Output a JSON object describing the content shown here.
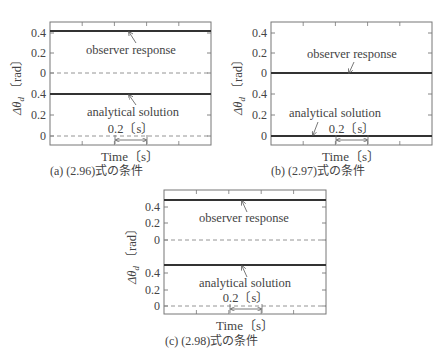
{
  "figure": {
    "xlabel": "Time〔s〕",
    "ylabel_symbol": "Δθ",
    "ylabel_sub": "d",
    "ylabel_unit": "〔rad〕",
    "scale_bar_label": "0.2〔s〕",
    "observer_label": "observer response",
    "analytical_label": "analytical solution"
  },
  "panels": [
    {
      "id": "a",
      "caption": "(a) (2.96)式の条件",
      "frame": {
        "x": 50,
        "y": 22,
        "w": 161,
        "h": 123
      },
      "upper_ticks": [
        {
          "label": "0.4",
          "y": 33
        },
        {
          "label": "0.2",
          "y": 53
        },
        {
          "label": "0",
          "y": 73
        }
      ],
      "lower_ticks": [
        {
          "label": "0.4",
          "y": 94
        },
        {
          "label": "0.2",
          "y": 115
        },
        {
          "label": "0",
          "y": 136
        }
      ],
      "observer_line_y": 31,
      "observer_zero_dashed": true,
      "analytical_line_y": 94,
      "analytical_zero_dashed": true,
      "observer_text": {
        "x": 86,
        "y": 54
      },
      "observer_arrow": {
        "x1": 136,
        "y1": 43,
        "x2": 129,
        "y2": 32
      },
      "analytical_text": {
        "x": 87,
        "y": 116
      },
      "analytical_arrow": {
        "x1": 136,
        "y1": 105,
        "x2": 129,
        "y2": 95
      },
      "scale": {
        "x1": 115,
        "x2": 147,
        "y": 140,
        "label_x": 131,
        "label_y": 133
      },
      "xlabel_pos": {
        "x": 130,
        "y": 161
      },
      "caption_pos": {
        "x": 50,
        "y": 175
      },
      "ylabel_pos": {
        "x": 21,
        "y": 84
      }
    },
    {
      "id": "b",
      "caption": "(b) (2.97)式の条件",
      "frame": {
        "x": 271,
        "y": 22,
        "w": 161,
        "h": 123
      },
      "upper_ticks": [
        {
          "label": "0.4",
          "y": 33
        },
        {
          "label": "0.2",
          "y": 53
        },
        {
          "label": "0",
          "y": 73
        }
      ],
      "lower_ticks": [
        {
          "label": "0.4",
          "y": 94
        },
        {
          "label": "0.2",
          "y": 115
        },
        {
          "label": "0",
          "y": 136
        }
      ],
      "observer_line_y": 73,
      "observer_zero_dashed": false,
      "analytical_line_y": 136,
      "analytical_zero_dashed": false,
      "observer_text": {
        "x": 307,
        "y": 58
      },
      "observer_arrow": {
        "x1": 354,
        "y1": 62,
        "x2": 349,
        "y2": 73
      },
      "analytical_text": {
        "x": 289,
        "y": 117
      },
      "analytical_arrow": {
        "x1": 318,
        "y1": 122,
        "x2": 313,
        "y2": 135
      },
      "scale": {
        "x1": 336,
        "x2": 368,
        "y": 140,
        "label_x": 352,
        "label_y": 133
      },
      "xlabel_pos": {
        "x": 351,
        "y": 161
      },
      "caption_pos": {
        "x": 271,
        "y": 175
      },
      "ylabel_pos": {
        "x": 242,
        "y": 84
      }
    },
    {
      "id": "c",
      "caption": "(c) (2.98)式の条件",
      "frame": {
        "x": 164,
        "y": 190,
        "w": 162,
        "h": 124
      },
      "upper_ticks": [
        {
          "label": "0.4",
          "y": 207
        },
        {
          "label": "0.2",
          "y": 223
        },
        {
          "label": "0",
          "y": 240
        }
      ],
      "lower_ticks": [
        {
          "label": "0.4",
          "y": 273
        },
        {
          "label": "0.2",
          "y": 290
        },
        {
          "label": "0",
          "y": 306
        }
      ],
      "observer_line_y": 200,
      "observer_zero_dashed": true,
      "analytical_line_y": 265,
      "analytical_zero_dashed": true,
      "observer_text": {
        "x": 199,
        "y": 222
      },
      "observer_arrow": {
        "x1": 247,
        "y1": 212,
        "x2": 242,
        "y2": 201
      },
      "analytical_text": {
        "x": 199,
        "y": 287
      },
      "analytical_arrow": {
        "x1": 247,
        "y1": 277,
        "x2": 242,
        "y2": 266
      },
      "scale": {
        "x1": 230,
        "x2": 262,
        "y": 309,
        "label_x": 246,
        "label_y": 302
      },
      "xlabel_pos": {
        "x": 245,
        "y": 330
      },
      "caption_pos": {
        "x": 165,
        "y": 345
      },
      "ylabel_pos": {
        "x": 136,
        "y": 253
      }
    }
  ],
  "chart_data": [
    {
      "type": "line",
      "title": "(a) (2.96)式の条件",
      "xlabel": "Time〔s〕",
      "ylabel": "Δθd〔rad〕",
      "yticks_upper": [
        0.4,
        0.2,
        0
      ],
      "yticks_lower": [
        0.4,
        0.2,
        0
      ],
      "scale_bar": "0.2〔s〕",
      "series": [
        {
          "name": "observer response",
          "values": "constant",
          "y": 0.42
        },
        {
          "name": "analytical solution",
          "values": "constant",
          "y": 0.4
        }
      ],
      "zero_line": "dashed"
    },
    {
      "type": "line",
      "title": "(b) (2.97)式の条件",
      "xlabel": "Time〔s〕",
      "ylabel": "Δθd〔rad〕",
      "yticks_upper": [
        0.4,
        0.2,
        0
      ],
      "yticks_lower": [
        0.4,
        0.2,
        0
      ],
      "scale_bar": "0.2〔s〕",
      "series": [
        {
          "name": "observer response",
          "values": "constant",
          "y": 0
        },
        {
          "name": "analytical solution",
          "values": "constant",
          "y": 0
        }
      ],
      "zero_line": "solid (coincides with data)"
    },
    {
      "type": "line",
      "title": "(c) (2.98)式の条件",
      "xlabel": "Time〔s〕",
      "ylabel": "Δθd〔rad〕",
      "yticks_upper": [
        0.4,
        0.2,
        0
      ],
      "yticks_lower": [
        0.4,
        0.2,
        0
      ],
      "scale_bar": "0.2〔s〕",
      "series": [
        {
          "name": "observer response",
          "values": "constant",
          "y": 0.48
        },
        {
          "name": "analytical solution",
          "values": "constant",
          "y": 0.48
        }
      ],
      "zero_line": "dashed"
    }
  ]
}
